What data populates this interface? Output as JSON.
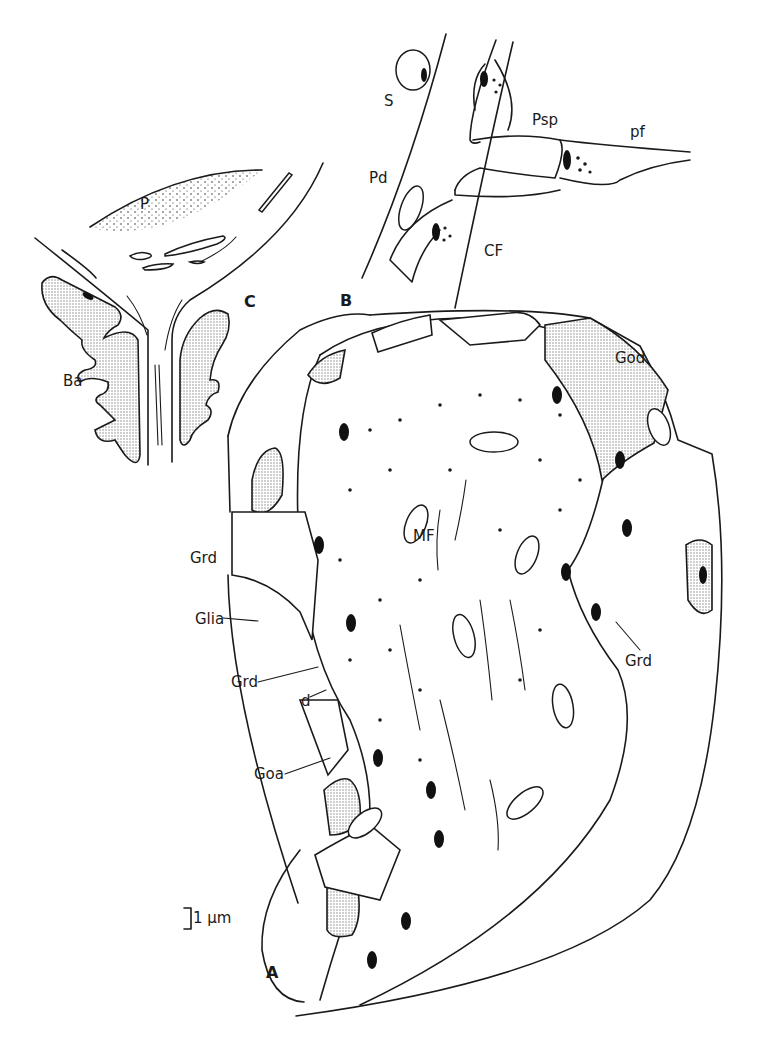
{
  "figure": {
    "type": "anatomical line drawing",
    "panels": [
      {
        "id": "A",
        "label": "A",
        "description": "Glomerulus: mossy fiber terminal surrounded by granule cell dendrites and Golgi elements"
      },
      {
        "id": "B",
        "label": "B",
        "description": "Purkinje dendrite with spine, parallel fiber and climbing fiber"
      },
      {
        "id": "C",
        "label": "C",
        "description": "Purkinje cell with basket axon"
      }
    ],
    "labels": {
      "P": "P",
      "C": "C",
      "Ba": "Ba",
      "S": "S",
      "Pd": "Pd",
      "Psp": "Psp",
      "pf": "pf",
      "CF": "CF",
      "B": "B",
      "God": "God",
      "MF": "MF",
      "Grd_left": "Grd",
      "Glia": "Glia",
      "Grd_mid": "Grd",
      "d": "d",
      "Goa": "Goa",
      "Grd_right": "Grd",
      "A": "A"
    },
    "scale_bar": {
      "label": "1 μm"
    },
    "colors": {
      "ink": "#1a1a1a",
      "background": "#ffffff",
      "stipple": "#9a9a9a"
    }
  }
}
